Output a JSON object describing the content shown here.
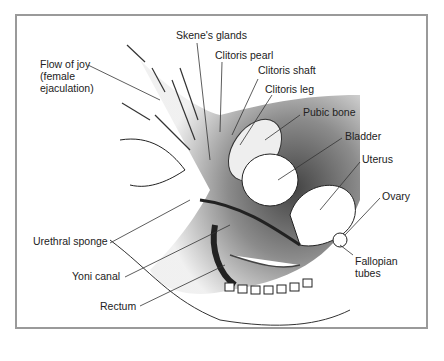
{
  "diagram": {
    "type": "anatomical-cross-section",
    "labels": [
      {
        "id": "skenes-glands",
        "text": "Skene's glands"
      },
      {
        "id": "clitoris-pearl",
        "text": "Clitoris pearl"
      },
      {
        "id": "flow-of-joy",
        "text": "Flow of joy"
      },
      {
        "id": "flow-of-joy-2",
        "text": "(female"
      },
      {
        "id": "flow-of-joy-3",
        "text": "ejaculation)"
      },
      {
        "id": "clitoris-shaft",
        "text": "Clitoris shaft"
      },
      {
        "id": "clitoris-leg",
        "text": "Clitoris leg"
      },
      {
        "id": "pubic-bone",
        "text": "Pubic bone"
      },
      {
        "id": "bladder",
        "text": "Bladder"
      },
      {
        "id": "uterus",
        "text": "Uterus"
      },
      {
        "id": "ovary",
        "text": "Ovary"
      },
      {
        "id": "urethral-sponge",
        "text": "Urethral sponge"
      },
      {
        "id": "fallopian-1",
        "text": "Fallopian"
      },
      {
        "id": "fallopian-2",
        "text": "tubes"
      },
      {
        "id": "yoni-canal",
        "text": "Yoni canal"
      },
      {
        "id": "rectum",
        "text": "Rectum"
      }
    ]
  }
}
